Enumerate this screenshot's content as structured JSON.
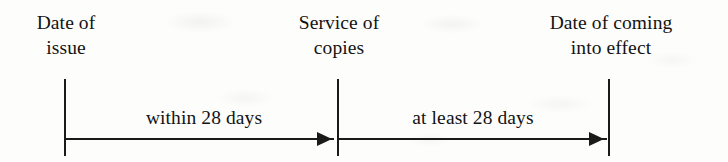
{
  "diagram": {
    "type": "timeline",
    "background_color": "#fdfdfc",
    "ink_color": "#1a1a1a",
    "nodes": [
      {
        "id": "date-of-issue",
        "line1": "Date of",
        "line2": "issue",
        "x": 64
      },
      {
        "id": "service-of-copies",
        "line1": "Service of",
        "line2": "copies",
        "x": 337
      },
      {
        "id": "date-of-coming-into-effect",
        "line1": "Date of coming",
        "line2": "into effect",
        "x": 608
      }
    ],
    "intervals": [
      {
        "id": "issue-to-service",
        "label": "within 28 days",
        "from": "date-of-issue",
        "to": "service-of-copies",
        "arrow": "right"
      },
      {
        "id": "service-to-effect",
        "label": "at least 28 days",
        "from": "service-of-copies",
        "to": "date-of-coming-into-effect",
        "arrow": "right"
      }
    ]
  }
}
